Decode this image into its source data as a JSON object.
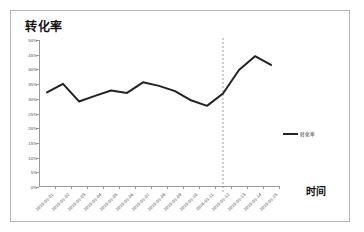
{
  "chart_data": {
    "type": "line",
    "title": "转化率",
    "xlabel": "时间",
    "ylabel": "",
    "ylim": [
      0,
      0.5
    ],
    "ytick_labels": [
      "0%",
      "5%",
      "10%",
      "15%",
      "20%",
      "25%",
      "30%",
      "35%",
      "40%",
      "45%",
      "50%"
    ],
    "ytick_values": [
      0,
      5,
      10,
      15,
      20,
      25,
      30,
      35,
      40,
      45,
      50
    ],
    "grid": false,
    "legend_position": "right",
    "legend_entries": [
      "转化率"
    ],
    "categories": [
      "2016-01-01",
      "2016-01-02",
      "2016-01-03",
      "2016-01-04",
      "2016-01-05",
      "2016-01-06",
      "2016-01-07",
      "2016-01-08",
      "2016-01-09",
      "2016-01-10",
      "2016-01-11",
      "2016-01-12",
      "2016-01-13",
      "2016-01-14",
      "2016-01-15"
    ],
    "series": [
      {
        "name": "转化率",
        "color": "#222222",
        "values": [
          32.2,
          35.1,
          29.1,
          31.0,
          32.8,
          32.0,
          35.6,
          34.4,
          32.6,
          29.5,
          27.6,
          31.8,
          39.8,
          44.5,
          41.5
        ]
      }
    ],
    "annotations": [
      {
        "type": "vertical-dashed-line",
        "at_category": "2016-01-12",
        "color": "#8a8a8a"
      }
    ]
  },
  "legend": {
    "label": "转化率"
  },
  "axes": {
    "x_title": "时间"
  }
}
